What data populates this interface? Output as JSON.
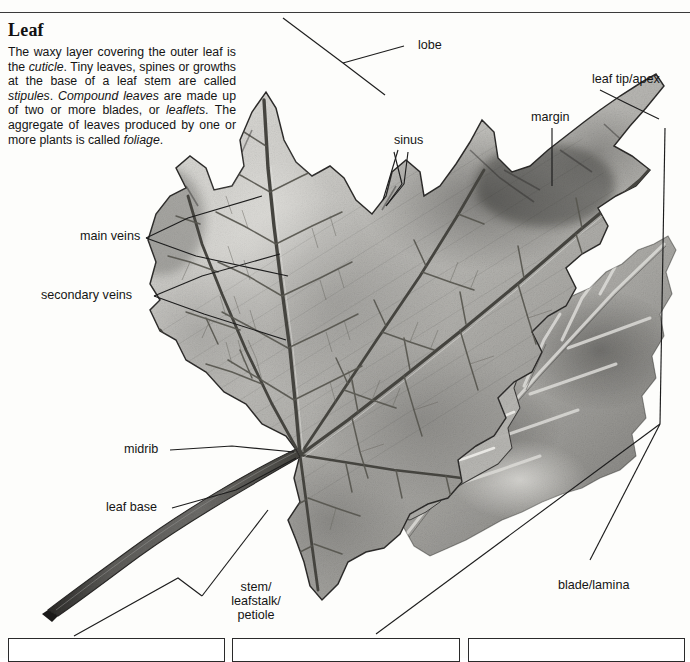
{
  "page": {
    "heading": "Leaf",
    "body_parts": [
      {
        "t": "The waxy layer covering the outer leaf is the ",
        "i": false
      },
      {
        "t": "cuticle",
        "i": true
      },
      {
        "t": ". Tiny leaves, spines or growths at the base of a leaf stem are called ",
        "i": false
      },
      {
        "t": "stipules",
        "i": true
      },
      {
        "t": ". ",
        "i": false
      },
      {
        "t": "Compound leaves",
        "i": true
      },
      {
        "t": " are made up of two or more blades, or ",
        "i": false
      },
      {
        "t": "leaflets",
        "i": true
      },
      {
        "t": ". The aggregate of leaves produced by one or more plants is called ",
        "i": false
      },
      {
        "t": "foliage",
        "i": true
      },
      {
        "t": ".",
        "i": false
      }
    ],
    "body_text": "The waxy layer covering the outer leaf is the cuticle. Tiny leaves, spines or growths at the base of a leaf stem are called stipules. Compound leaves are made up of two or more blades, or leaflets. The aggregate of leaves produced by one or more plants is called foliage."
  },
  "labels": {
    "lobe": "lobe",
    "sinus": "sinus",
    "leaf_tip_apex": "leaf tip/apex",
    "margin": "margin",
    "main_veins": "main veins",
    "secondary_veins": "secondary veins",
    "midrib": "midrib",
    "leaf_base": "leaf base",
    "stem_petiole": "stem/\nleafstalk/\npetiole",
    "blade_lamina": "blade/lamina"
  },
  "illustration": {
    "subject": "maple-leaf-pencil-drawing",
    "style": "graphite pencil shading, grayscale"
  },
  "colors": {
    "background": "#fdfdfb",
    "text": "#151515",
    "leader_line": "#1d1d1d",
    "rule": "#3a3a3a",
    "leaf_light": "#d5d4d0",
    "leaf_mid": "#a9a8a4",
    "leaf_dark": "#6e6d6a",
    "leaf_darkest": "#3c3b39",
    "vein": "#4a4947",
    "petiole": "#4e4d4a"
  },
  "bottom_boxes": [
    {
      "name": "panel-1"
    },
    {
      "name": "panel-2"
    },
    {
      "name": "panel-3"
    }
  ]
}
